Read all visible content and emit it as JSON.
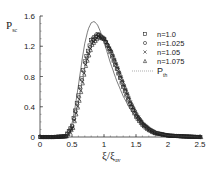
{
  "chart_data": {
    "type": "scatter",
    "title": "",
    "xlabel": "ξ/ξ_av",
    "ylabel": "P_sc",
    "xlim": [
      0,
      2.5
    ],
    "ylim": [
      0,
      1.6
    ],
    "xticks": [
      "0",
      "0.5",
      "1",
      "1.5",
      "2",
      "2.5"
    ],
    "yticks": [
      "0",
      "0.4",
      "0.8",
      "1.2",
      "1.6"
    ],
    "grid": false,
    "legend_position": "upper right",
    "series": [
      {
        "name": "n=1.0",
        "marker": "square",
        "x": [
          0.0,
          0.2,
          0.4,
          0.5,
          0.6,
          0.7,
          0.8,
          0.9,
          1.0,
          1.1,
          1.2,
          1.3,
          1.4,
          1.5,
          1.6,
          1.7,
          1.8,
          2.0,
          2.2,
          2.5
        ],
        "y": [
          0,
          0,
          0.01,
          0.15,
          0.55,
          1.0,
          1.28,
          1.36,
          1.3,
          1.12,
          0.9,
          0.66,
          0.44,
          0.27,
          0.16,
          0.09,
          0.05,
          0.02,
          0.01,
          0
        ]
      },
      {
        "name": "n=1.025",
        "marker": "circle",
        "x": [
          0.0,
          0.2,
          0.4,
          0.5,
          0.6,
          0.7,
          0.8,
          0.9,
          1.0,
          1.1,
          1.2,
          1.3,
          1.4,
          1.5,
          1.6,
          1.7,
          1.8,
          2.0,
          2.2,
          2.5
        ],
        "y": [
          0,
          0,
          0.01,
          0.14,
          0.53,
          0.98,
          1.26,
          1.35,
          1.3,
          1.13,
          0.9,
          0.67,
          0.45,
          0.28,
          0.17,
          0.1,
          0.05,
          0.02,
          0.01,
          0
        ]
      },
      {
        "name": "n=1.05",
        "marker": "x",
        "x": [
          0.0,
          0.2,
          0.4,
          0.5,
          0.6,
          0.7,
          0.8,
          0.9,
          1.0,
          1.1,
          1.2,
          1.3,
          1.4,
          1.5,
          1.6,
          1.7,
          1.8,
          2.0,
          2.2,
          2.5
        ],
        "y": [
          0,
          0,
          0.01,
          0.13,
          0.5,
          0.96,
          1.24,
          1.33,
          1.29,
          1.13,
          0.91,
          0.68,
          0.46,
          0.29,
          0.17,
          0.1,
          0.06,
          0.02,
          0.01,
          0
        ]
      },
      {
        "name": "n=1.075",
        "marker": "triangle",
        "x": [
          0.0,
          0.2,
          0.4,
          0.5,
          0.6,
          0.7,
          0.8,
          0.9,
          1.0,
          1.1,
          1.2,
          1.3,
          1.4,
          1.5,
          1.6,
          1.7,
          1.8,
          2.0,
          2.2,
          2.5
        ],
        "y": [
          0,
          0,
          0.01,
          0.12,
          0.48,
          0.94,
          1.22,
          1.32,
          1.29,
          1.14,
          0.92,
          0.69,
          0.47,
          0.3,
          0.18,
          0.11,
          0.06,
          0.02,
          0.01,
          0
        ]
      },
      {
        "name": "P_th",
        "marker": "line",
        "x": [
          0.4,
          0.45,
          0.5,
          0.55,
          0.6,
          0.65,
          0.7,
          0.75,
          0.8,
          0.85,
          0.9,
          0.95,
          1.0,
          1.05,
          1.1,
          1.2,
          1.3,
          1.4,
          1.5,
          1.6,
          1.7,
          1.8,
          1.9,
          2.0,
          2.2,
          2.5
        ],
        "y": [
          0,
          0.05,
          0.18,
          0.4,
          0.68,
          0.98,
          1.24,
          1.42,
          1.51,
          1.53,
          1.48,
          1.38,
          1.25,
          1.12,
          0.98,
          0.74,
          0.54,
          0.38,
          0.26,
          0.17,
          0.11,
          0.07,
          0.04,
          0.02,
          0.01,
          0
        ]
      }
    ]
  }
}
